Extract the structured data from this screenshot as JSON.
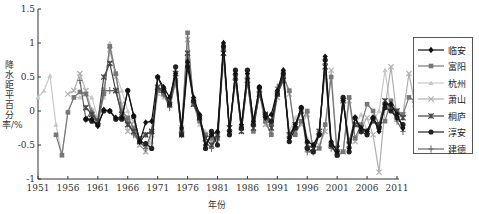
{
  "chart_data": {
    "type": "line",
    "title": "",
    "xlabel": "年份",
    "ylabel": "降水距平百分率/%",
    "xlim": [
      1951,
      2011
    ],
    "ylim": [
      -1,
      1.5
    ],
    "x_ticks": [
      "1951",
      "1956",
      "1961",
      "1966",
      "1971",
      "1976",
      "1981",
      "1986",
      "1991",
      "1996",
      "2001",
      "2006",
      "2011"
    ],
    "y_ticks": [
      "-1",
      "-0.5",
      "0",
      "0.5",
      "1",
      "1.5"
    ],
    "grid": false,
    "legend_position": "right",
    "series": [
      {
        "name": "临安",
        "color": "#111111",
        "marker": "diamond",
        "start": 1959,
        "values": [
          -0.12,
          -0.12,
          -0.22,
          0.02,
          0.0,
          -0.1,
          -0.1,
          0.3,
          -0.07,
          -0.45,
          -0.17,
          -0.15,
          0.5,
          0.35,
          0.2,
          0.55,
          -0.25,
          0.72,
          0.2,
          -0.05,
          -0.5,
          -0.35,
          -0.3,
          1.0,
          -0.3,
          0.55,
          -0.2,
          0.55,
          -0.15,
          0.35,
          -0.1,
          -0.05,
          0.3,
          0.6,
          -0.4,
          -0.2,
          0.05,
          -0.45,
          -0.5,
          -0.35,
          0.8,
          -0.45,
          -0.6,
          0.15,
          -0.55,
          -0.1,
          -0.25,
          -0.3,
          -0.1,
          -0.3,
          0.1,
          0.1,
          -0.05,
          -0.25
        ]
      },
      {
        "name": "富阳",
        "color": "#777777",
        "marker": "square",
        "start": 1954,
        "values": [
          -0.35,
          -0.65,
          -0.02,
          0.2,
          0.28,
          0.25,
          -0.05,
          -0.2,
          0.25,
          0.95,
          0.55,
          0.0,
          -0.1,
          -0.25,
          -0.4,
          -0.35,
          -0.3,
          0.3,
          0.25,
          0.1,
          0.45,
          -0.3,
          1.15,
          0.1,
          -0.15,
          -0.35,
          -0.4,
          -0.4,
          0.9,
          -0.3,
          0.5,
          -0.25,
          0.45,
          -0.3,
          0.3,
          -0.15,
          -0.35,
          0.25,
          0.5,
          0.3,
          -0.35,
          -0.15,
          0.0,
          -0.6,
          -0.55,
          -0.2,
          0.5,
          -0.65,
          -0.6,
          0.2,
          -0.4,
          -0.2,
          0.1,
          0.0,
          -0.2,
          -0.15,
          0.15,
          0.0,
          -0.05,
          0.2,
          0.15
        ]
      },
      {
        "name": "杭州",
        "color": "#c8c8c8",
        "marker": "triangle",
        "start": 1951,
        "values": [
          0.2,
          0.3,
          0.52,
          -0.2,
          -0.65,
          0.0,
          0.2,
          0.2,
          0.25,
          0.2,
          -0.1,
          0.2,
          1.0,
          0.55,
          0.3,
          0.0,
          -0.3,
          -0.5,
          -0.6,
          -0.45,
          0.25,
          0.2,
          0.1,
          0.4,
          -0.2,
          0.9,
          0.1,
          -0.2,
          -0.3,
          -0.35,
          -0.3,
          0.7,
          -0.25,
          0.4,
          -0.2,
          0.4,
          -0.1,
          0.25,
          -0.2,
          -0.2,
          0.25,
          0.45,
          -0.3,
          -0.1,
          0.0,
          -0.4,
          -0.5,
          -0.3,
          0.55,
          -0.5,
          -0.65,
          0.1,
          -0.45,
          -0.2,
          -0.05,
          -0.3,
          -0.15,
          0.0,
          0.6,
          0.0
        ]
      },
      {
        "name": "萧山",
        "color": "#b0b0b0",
        "marker": "cross",
        "start": 1956,
        "values": [
          0.25,
          0.3,
          0.55,
          0.3,
          0.0,
          -0.1,
          0.3,
          0.9,
          0.5,
          0.1,
          -0.3,
          -0.15,
          -0.5,
          -0.6,
          -0.35,
          0.3,
          0.25,
          0.15,
          0.45,
          -0.25,
          1.05,
          0.15,
          -0.1,
          -0.4,
          -0.45,
          -0.4,
          0.85,
          -0.25,
          0.5,
          -0.25,
          0.5,
          -0.2,
          0.3,
          -0.2,
          -0.3,
          0.2,
          0.55,
          0.25,
          -0.3,
          -0.2,
          -0.05,
          -0.55,
          -0.5,
          -0.3,
          0.6,
          -0.6,
          -0.6,
          0.15,
          -0.45,
          -0.25,
          -0.1,
          -0.35,
          -0.9,
          0.05,
          0.65,
          -0.1,
          -0.05,
          0.55,
          0.1
        ]
      },
      {
        "name": "桐庐",
        "color": "#444444",
        "marker": "star",
        "start": 1959,
        "values": [
          0.05,
          -0.05,
          -0.15,
          0.5,
          0.7,
          0.3,
          -0.05,
          -0.2,
          -0.3,
          -0.45,
          -0.35,
          -0.3,
          0.35,
          0.3,
          0.1,
          0.55,
          -0.35,
          0.85,
          0.1,
          -0.1,
          -0.4,
          -0.5,
          -0.35,
          0.85,
          -0.25,
          0.5,
          -0.3,
          0.45,
          -0.25,
          0.25,
          -0.05,
          -0.25,
          0.25,
          0.45,
          -0.35,
          -0.2,
          0.0,
          -0.5,
          -0.55,
          -0.3,
          0.65,
          -0.5,
          -0.55,
          0.15,
          -0.5,
          -0.2,
          -0.25,
          -0.3,
          -0.15,
          -0.2,
          0.15,
          0.05,
          0.0,
          -0.1
        ]
      },
      {
        "name": "淳安",
        "color": "#222222",
        "marker": "circle",
        "start": 1959,
        "values": [
          -0.12,
          -0.15,
          -0.2,
          0.0,
          0.0,
          -0.12,
          -0.12,
          0.3,
          -0.08,
          -0.45,
          -0.48,
          -0.55,
          0.5,
          0.3,
          0.1,
          0.65,
          -0.35,
          0.65,
          0.15,
          -0.1,
          -0.55,
          -0.3,
          -0.5,
          0.95,
          -0.35,
          0.6,
          -0.25,
          0.6,
          -0.2,
          0.35,
          -0.05,
          -0.15,
          0.25,
          0.55,
          -0.45,
          -0.25,
          0.05,
          -0.55,
          -0.6,
          -0.35,
          0.75,
          -0.5,
          -0.65,
          0.2,
          -0.6,
          -0.1,
          -0.3,
          -0.35,
          -0.1,
          -0.25,
          0.05,
          0.0,
          -0.1,
          -0.2
        ]
      },
      {
        "name": "建德",
        "color": "#666666",
        "marker": "plus",
        "start": 1958,
        "values": [
          0.45,
          -0.12,
          0.0,
          -0.15,
          0.3,
          0.3,
          0.3,
          -0.05,
          -0.15,
          -0.35,
          -0.45,
          -0.55,
          -0.3,
          0.35,
          0.25,
          0.05,
          0.45,
          -0.3,
          0.75,
          0.15,
          -0.1,
          -0.45,
          -0.55,
          -0.35,
          0.9,
          -0.3,
          0.45,
          -0.25,
          0.5,
          -0.2,
          0.25,
          -0.05,
          -0.2,
          0.35,
          0.5,
          -0.35,
          -0.25,
          0.0,
          -0.6,
          -0.6,
          -0.3,
          0.7,
          -0.55,
          -0.6,
          0.15,
          -0.45,
          -0.1,
          -0.3,
          -0.3,
          -0.1,
          -0.25,
          0.1,
          0.05,
          -0.15,
          -0.3
        ]
      }
    ]
  },
  "legend": {
    "items": [
      "临安",
      "富阳",
      "杭州",
      "萧山",
      "桐庐",
      "淳安",
      "建德"
    ]
  },
  "axes": {
    "xlabel": "年份",
    "ylabel": "降水距平百分率/%"
  }
}
